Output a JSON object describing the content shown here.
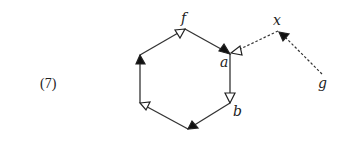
{
  "equation_number": "(7)",
  "colors": {
    "stroke": "#333333",
    "text": "#222222",
    "background": "#ffffff"
  },
  "labels": {
    "f": "f",
    "a": "a",
    "b": "b",
    "x": "x",
    "g": "g"
  },
  "nodes": [
    {
      "id": "top",
      "label": "f",
      "x": 185,
      "y": 29
    },
    {
      "id": "upper-right",
      "label": "a",
      "x": 230,
      "y": 54
    },
    {
      "id": "lower-right",
      "label": "b",
      "x": 230,
      "y": 103
    },
    {
      "id": "bottom",
      "label": "",
      "x": 188,
      "y": 129
    },
    {
      "id": "lower-left",
      "label": "",
      "x": 140,
      "y": 103
    },
    {
      "id": "upper-left",
      "label": "",
      "x": 140,
      "y": 55
    },
    {
      "id": "x",
      "label": "x",
      "x": 278,
      "y": 31
    },
    {
      "id": "g",
      "label": "g",
      "x": 322,
      "y": 75
    }
  ],
  "edges": [
    {
      "from": "upper-left",
      "to": "top",
      "style": "solid",
      "arrow": "open",
      "arrow_at": "end"
    },
    {
      "from": "top",
      "to": "upper-right",
      "style": "solid",
      "arrow": "filled",
      "arrow_at": "end"
    },
    {
      "from": "upper-right",
      "to": "lower-right",
      "style": "solid",
      "arrow": "open",
      "arrow_at": "end"
    },
    {
      "from": "lower-right",
      "to": "bottom",
      "style": "solid",
      "arrow": "filled",
      "arrow_at": "end"
    },
    {
      "from": "bottom",
      "to": "lower-left",
      "style": "solid",
      "arrow": "open",
      "arrow_at": "end"
    },
    {
      "from": "lower-left",
      "to": "upper-left",
      "style": "solid",
      "arrow": "filled",
      "arrow_at": "end"
    },
    {
      "from": "x",
      "to": "upper-right",
      "style": "dashed",
      "arrow": "open",
      "arrow_at": "end"
    },
    {
      "from": "g",
      "to": "x",
      "style": "dashed",
      "arrow": "filled",
      "arrow_at": "end"
    }
  ]
}
